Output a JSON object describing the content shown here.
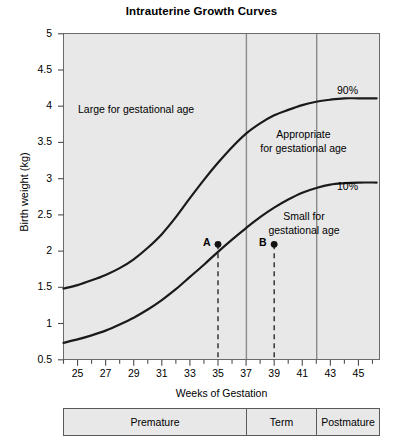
{
  "chart_data": {
    "type": "line",
    "title": "Intrauterine Growth Curves",
    "xlabel": "Weeks of Gestation",
    "ylabel": "Birth weight (kg)",
    "xlim": [
      24,
      46.5
    ],
    "ylim": [
      0.2,
      5
    ],
    "grid": false,
    "legend_position": "inline-right",
    "x_ticks_major": [
      25,
      27,
      29,
      31,
      33,
      35,
      37,
      39,
      41,
      43,
      45
    ],
    "x_ticks_minor": [
      24,
      26,
      28,
      30,
      32,
      34,
      36,
      38,
      40,
      42,
      44,
      46
    ],
    "y_ticks": [
      0.5,
      1,
      1.5,
      2,
      2.5,
      3,
      3.5,
      4,
      4.5,
      5
    ],
    "series": [
      {
        "name": "90%",
        "label": "90%",
        "x": [
          24,
          25,
          26,
          27,
          28,
          29,
          30,
          31,
          32,
          33,
          34,
          35,
          36,
          37,
          38,
          39,
          40,
          41,
          42,
          43,
          44,
          45,
          46.3
        ],
        "values": [
          1.25,
          1.3,
          1.37,
          1.45,
          1.55,
          1.68,
          1.85,
          2.05,
          2.3,
          2.58,
          2.85,
          3.1,
          3.33,
          3.53,
          3.68,
          3.8,
          3.88,
          3.95,
          4.0,
          4.03,
          4.05,
          4.05,
          4.05
        ]
      },
      {
        "name": "10%",
        "label": "10%",
        "x": [
          24,
          25,
          26,
          27,
          28,
          29,
          30,
          31,
          32,
          33,
          34,
          35,
          36,
          37,
          38,
          39,
          40,
          41,
          42,
          43,
          44,
          45,
          46.3
        ],
        "values": [
          0.45,
          0.5,
          0.56,
          0.63,
          0.72,
          0.82,
          0.94,
          1.08,
          1.24,
          1.42,
          1.6,
          1.79,
          1.97,
          2.14,
          2.3,
          2.44,
          2.56,
          2.66,
          2.73,
          2.78,
          2.8,
          2.81,
          2.81
        ]
      }
    ],
    "points": [
      {
        "label": "A",
        "x": 35,
        "y": 1.9,
        "dropline": true
      },
      {
        "label": "B",
        "x": 39,
        "y": 1.9,
        "dropline": true
      }
    ],
    "vertical_lines": [
      37,
      42
    ],
    "annotations": [
      {
        "text": "Large for gestational age",
        "x": 30.5,
        "y": 3.95
      },
      {
        "text_lines": [
          "Appropriate",
          "for gestational age"
        ],
        "x": 40.2,
        "y": 3.42
      },
      {
        "text_lines": [
          "Small for",
          "gestational age"
        ],
        "x": 40.8,
        "y": 2.32
      }
    ],
    "region_colors": {
      "plot_background": "#e8e8e8",
      "curve": "#1a1a1a",
      "axis": "#4d4d4d"
    }
  },
  "title": "Intrauterine Growth Curves",
  "axes": {
    "y_title": "Birth weight (kg)",
    "x_title": "Weeks of Gestation",
    "y_tick_labels": [
      "5",
      "4.5",
      "4",
      "3.5",
      "3",
      "2.5",
      "2",
      "1.5",
      "1",
      "0.5"
    ],
    "x_tick_labels": [
      "25",
      "27",
      "29",
      "31",
      "33",
      "35",
      "37",
      "39",
      "41",
      "43",
      "45"
    ]
  },
  "annotations": {
    "large": "Large for gestational age",
    "appropriate_line1": "Appropriate",
    "appropriate_line2": "for gestational age",
    "small_line1": "Small for",
    "small_line2": "gestational age",
    "pct90": "90%",
    "pct10": "10%",
    "point_a": "A",
    "point_b": "B"
  },
  "stages": [
    {
      "label": "Premature"
    },
    {
      "label": "Term"
    },
    {
      "label": "Postmature"
    }
  ]
}
